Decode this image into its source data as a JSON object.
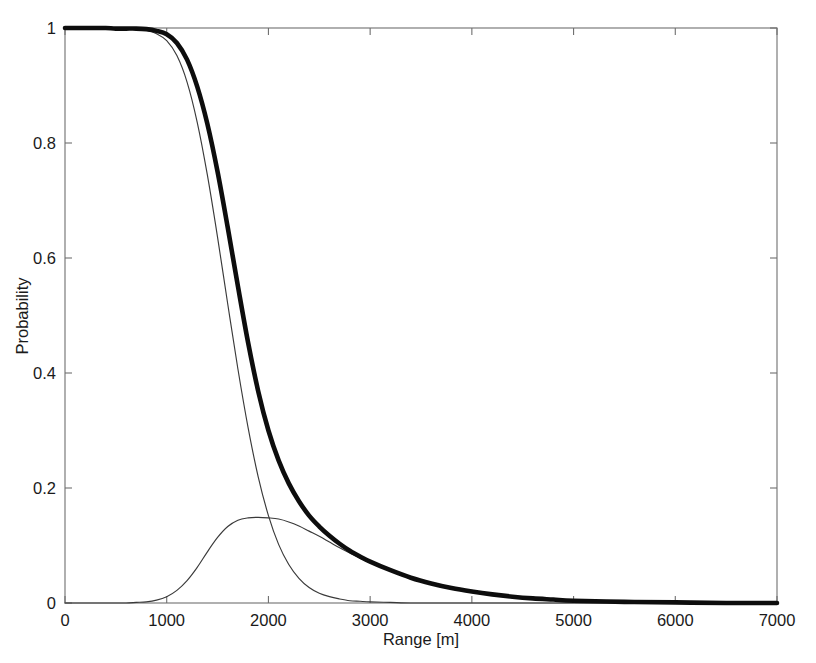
{
  "figure": {
    "background_color": "#ffffff",
    "frame_color": "#6f6f6f"
  },
  "axes": {
    "x_title": "Range [m]",
    "y_title": "Probability",
    "x_ticks": [
      "0",
      "1000",
      "2000",
      "3000",
      "4000",
      "5000",
      "6000",
      "7000"
    ],
    "y_ticks": [
      "0",
      "0.2",
      "0.4",
      "0.6",
      "0.8",
      "1"
    ]
  },
  "chart_data": {
    "type": "line",
    "title": "",
    "xlabel": "Range [m]",
    "ylabel": "Probability",
    "xlim": [
      0,
      7000
    ],
    "ylim": [
      0,
      1
    ],
    "xticks": [
      0,
      1000,
      2000,
      3000,
      4000,
      5000,
      6000,
      7000
    ],
    "yticks": [
      0,
      0.2,
      0.4,
      0.6,
      0.8,
      1
    ],
    "grid": false,
    "legend": "none",
    "x": [
      0,
      100,
      200,
      300,
      400,
      500,
      600,
      700,
      800,
      900,
      1000,
      1100,
      1200,
      1300,
      1400,
      1500,
      1600,
      1700,
      1800,
      1900,
      2000,
      2100,
      2200,
      2300,
      2400,
      2500,
      2600,
      2700,
      2800,
      2900,
      3000,
      3200,
      3400,
      3600,
      3800,
      4000,
      4200,
      4400,
      4600,
      4800,
      5000,
      5500,
      6000,
      6500,
      7000
    ],
    "series": [
      {
        "name": "detection-probability-base",
        "style": "thin-solid",
        "color": "#3a3a3a",
        "linewidth": 1.15,
        "values": [
          1.0,
          1.0,
          1.0,
          1.0,
          1.0,
          0.999,
          0.999,
          0.998,
          0.996,
          0.99,
          0.978,
          0.952,
          0.906,
          0.836,
          0.744,
          0.636,
          0.52,
          0.407,
          0.305,
          0.219,
          0.152,
          0.102,
          0.067,
          0.043,
          0.027,
          0.017,
          0.011,
          0.007,
          0.004,
          0.003,
          0.002,
          0.001,
          0.0,
          0.0,
          0.0,
          0.0,
          0.0,
          0.0,
          0.0,
          0.0,
          0.0,
          0.0,
          0.0,
          0.0,
          0.0
        ]
      },
      {
        "name": "false-alarm-contribution",
        "style": "thin-solid",
        "color": "#4a4a4a",
        "linewidth": 1.15,
        "values": [
          0.0,
          0.0,
          0.0,
          0.0,
          0.0,
          0.0,
          0.0,
          0.001,
          0.002,
          0.005,
          0.011,
          0.022,
          0.039,
          0.062,
          0.089,
          0.114,
          0.133,
          0.144,
          0.148,
          0.149,
          0.148,
          0.146,
          0.141,
          0.134,
          0.125,
          0.116,
          0.106,
          0.096,
          0.087,
          0.078,
          0.07,
          0.056,
          0.044,
          0.034,
          0.026,
          0.02,
          0.015,
          0.011,
          0.008,
          0.006,
          0.004,
          0.002,
          0.001,
          0.0,
          0.0
        ]
      },
      {
        "name": "total-probability",
        "style": "thick-solid",
        "color": "#0d0d0d",
        "linewidth": 4.6,
        "values": [
          1.0,
          1.0,
          1.0,
          1.0,
          1.0,
          0.999,
          0.999,
          0.999,
          0.998,
          0.995,
          0.989,
          0.974,
          0.945,
          0.898,
          0.833,
          0.75,
          0.653,
          0.551,
          0.453,
          0.368,
          0.3,
          0.248,
          0.208,
          0.177,
          0.152,
          0.133,
          0.117,
          0.103,
          0.091,
          0.081,
          0.072,
          0.057,
          0.044,
          0.034,
          0.026,
          0.02,
          0.015,
          0.011,
          0.008,
          0.006,
          0.004,
          0.002,
          0.001,
          0.0,
          0.0
        ]
      }
    ]
  }
}
